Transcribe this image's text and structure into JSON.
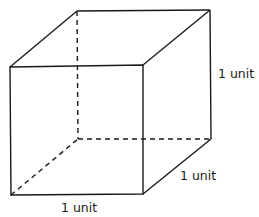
{
  "diagram": {
    "type": "cube",
    "vertices": {
      "front_top_left": [
        10,
        67
      ],
      "front_top_right": [
        143,
        65
      ],
      "front_bottom_left": [
        11,
        195
      ],
      "front_bottom_right": [
        143,
        194
      ],
      "back_top_left": [
        77,
        11
      ],
      "back_top_right": [
        210,
        10
      ],
      "back_bottom_left": [
        78,
        139
      ],
      "back_bottom_right": [
        211,
        139
      ]
    },
    "labels": {
      "height": "1 unit",
      "depth": "1 unit",
      "width": "1 unit"
    },
    "colors": {
      "stroke": "#1a1a1a",
      "background": "#ffffff"
    }
  }
}
